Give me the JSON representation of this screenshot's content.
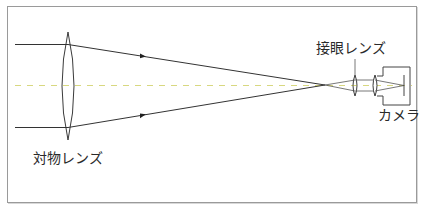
{
  "diagram": {
    "type": "optical-ray-diagram",
    "labels": {
      "objective_lens": "対物レンズ",
      "eyepiece_lens": "接眼レンズ",
      "camera": "カメラ"
    },
    "colors": {
      "rays": "#333333",
      "optical_axis": "#d8d880",
      "frame": "#9a9a9a",
      "text": "#2a2a2a"
    },
    "elements": [
      {
        "name": "objective-lens",
        "shape": "biconvex",
        "x": 68,
        "y_top": 32,
        "y_bottom": 140
      },
      {
        "name": "focal-point",
        "x": 325,
        "y": 85
      },
      {
        "name": "eyepiece-lens",
        "shape": "biconvex",
        "x": 355,
        "y_top": 76,
        "y_bottom": 95
      },
      {
        "name": "camera-lens",
        "shape": "biconvex",
        "x": 375,
        "y_top": 76,
        "y_bottom": 95
      },
      {
        "name": "camera-body",
        "x": 383,
        "y": 67,
        "w": 27,
        "h": 38
      },
      {
        "name": "camera-sensor",
        "x": 404,
        "y_top": 75,
        "y_bottom": 96
      }
    ],
    "rays": [
      {
        "from": [
          15,
          44
        ],
        "to": [
          68,
          44
        ],
        "next": [
          325,
          85
        ],
        "arrow_at": [
          143,
          56
        ]
      },
      {
        "from": [
          15,
          127
        ],
        "to": [
          68,
          127
        ],
        "next": [
          325,
          85
        ],
        "arrow_at": [
          143,
          114
        ]
      }
    ]
  }
}
